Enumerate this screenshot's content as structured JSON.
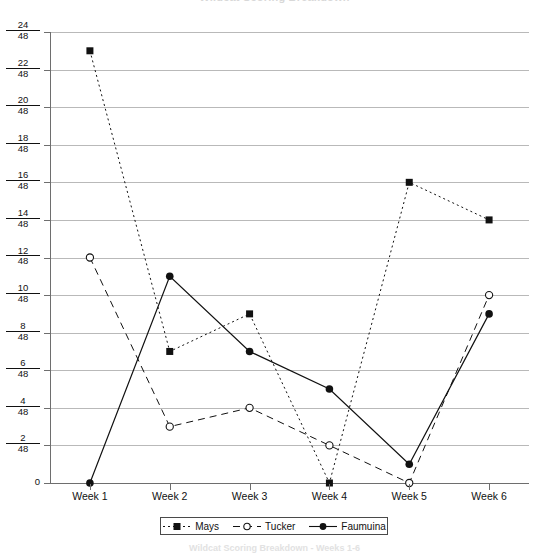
{
  "top_title": "Wildcat Scoring Breakdown",
  "bottom_caption": "Wildcat Scoring Breakdown - Weeks 1-6",
  "legend": {
    "position": "bottom-center",
    "entries": [
      {
        "label": "Mays",
        "marker": "filled-square",
        "line": "dotted",
        "color": "#111111"
      },
      {
        "label": "Tucker",
        "marker": "open-circle",
        "line": "dashed",
        "color": "#111111"
      },
      {
        "label": "Faumuina",
        "marker": "filled-circle",
        "line": "solid",
        "color": "#111111"
      }
    ]
  },
  "axes": {
    "y_tick_labels": [
      {
        "num": "24",
        "den": "48",
        "value": 24
      },
      {
        "num": "22",
        "den": "48",
        "value": 22
      },
      {
        "num": "20",
        "den": "48",
        "value": 20
      },
      {
        "num": "18",
        "den": "48",
        "value": 18
      },
      {
        "num": "16",
        "den": "48",
        "value": 16
      },
      {
        "num": "14",
        "den": "48",
        "value": 14
      },
      {
        "num": "12",
        "den": "48",
        "value": 12
      },
      {
        "num": "10",
        "den": "48",
        "value": 10
      },
      {
        "num": "8",
        "den": "48",
        "value": 8
      },
      {
        "num": "6",
        "den": "48",
        "value": 6
      },
      {
        "num": "4",
        "den": "48",
        "value": 4
      },
      {
        "num": "2",
        "den": "48",
        "value": 2
      },
      {
        "num": "0",
        "den": "",
        "value": 0
      }
    ],
    "x_tick_labels": [
      "Week 1",
      "Week 2",
      "Week 3",
      "Week 4",
      "Week 5",
      "Week 6"
    ]
  },
  "chart_data": {
    "type": "line",
    "title": "Wildcat Scoring Breakdown",
    "xlabel": "",
    "ylabel": "",
    "ylim": [
      0,
      24
    ],
    "grid": true,
    "legend_position": "bottom-center",
    "categories": [
      "Week 1",
      "Week 2",
      "Week 3",
      "Week 4",
      "Week 5",
      "Week 6"
    ],
    "series": [
      {
        "name": "Mays",
        "values": [
          23,
          7,
          9,
          0,
          16,
          14
        ],
        "marker": "filled-square",
        "line": "dotted"
      },
      {
        "name": "Tucker",
        "values": [
          12,
          3,
          4,
          2,
          0,
          10
        ],
        "marker": "open-circle",
        "line": "dashed"
      },
      {
        "name": "Faumuina",
        "values": [
          0,
          11,
          7,
          5,
          1,
          9
        ],
        "marker": "filled-circle",
        "line": "solid"
      }
    ]
  }
}
